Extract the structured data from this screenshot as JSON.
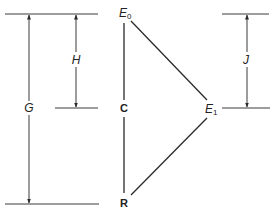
{
  "diagram": {
    "labels": {
      "G": "G",
      "H": "H",
      "J": "J",
      "E0_main": "E",
      "E0_sub": "0",
      "E1_main": "E",
      "E1_sub": "1",
      "C": "C",
      "R": "R"
    },
    "nodes": [
      {
        "id": "E0",
        "label": "E0"
      },
      {
        "id": "C",
        "label": "C"
      },
      {
        "id": "R",
        "label": "R"
      },
      {
        "id": "E1",
        "label": "E1"
      }
    ],
    "edges": [
      {
        "from": "E0",
        "to": "C"
      },
      {
        "from": "C",
        "to": "R"
      },
      {
        "from": "E0",
        "to": "E1"
      },
      {
        "from": "E1",
        "to": "R"
      }
    ],
    "dimensions": [
      {
        "label": "G",
        "from_level": "E0",
        "to_level": "R"
      },
      {
        "label": "H",
        "from_level": "E0",
        "to_level": "C"
      },
      {
        "label": "J",
        "from_level": "E0",
        "to_level": "E1"
      }
    ],
    "colors": {
      "line": "#3a3a3a",
      "text": "#222222",
      "background": "#ffffff"
    }
  }
}
